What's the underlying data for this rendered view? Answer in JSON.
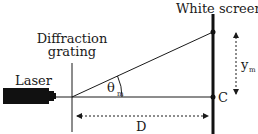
{
  "diagram": {
    "labels": {
      "screen": "White screen",
      "grating_line1": "Diffraction",
      "grating_line2": "grating",
      "laser": "Laser",
      "theta": "θ",
      "theta_sub": "m",
      "ym": "y",
      "ym_sub": "m",
      "center": "C",
      "distance": "D"
    },
    "colors": {
      "ink": "#1a1a1a",
      "background": "#ffffff"
    }
  }
}
